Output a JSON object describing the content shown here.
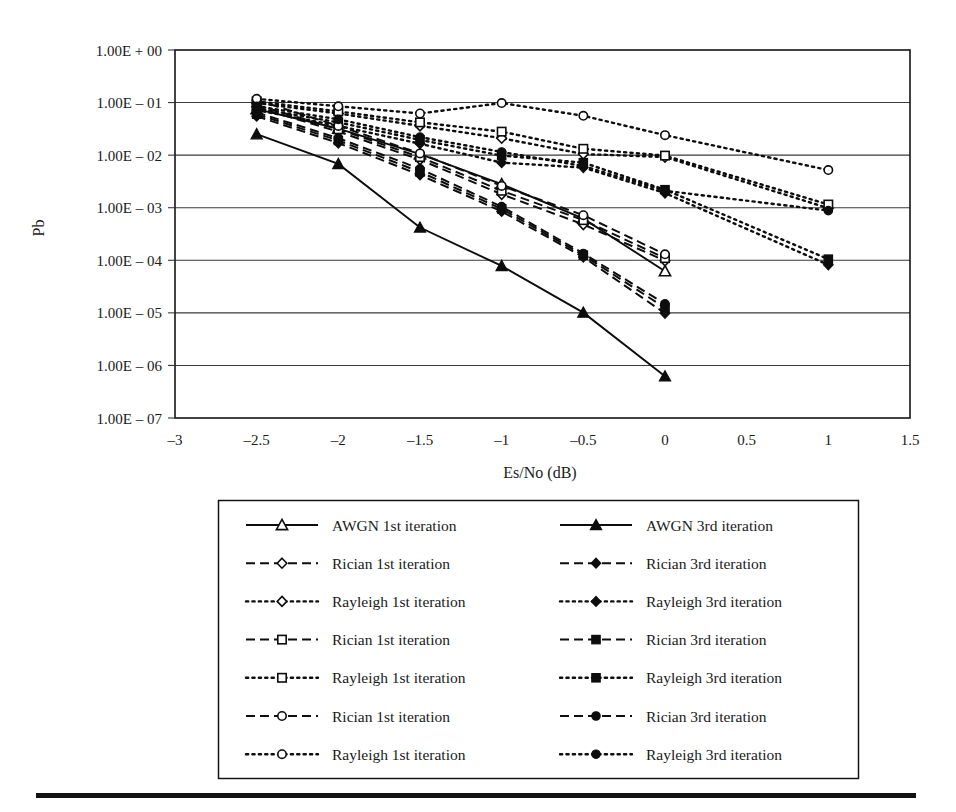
{
  "figure": {
    "background": "#ffffff",
    "ink_color": "#0d0d0d",
    "bottom_rule": true
  },
  "axes": {
    "ylabel": "Pb",
    "xlabel": "Es/No (dB)",
    "y_tick_labels": [
      "1.00E + 00",
      "1.00E – 01",
      "1.00E – 02",
      "1.00E – 03",
      "1.00E – 04",
      "1.00E – 05",
      "1.00E – 06",
      "1.00E – 07"
    ],
    "x_tick_labels": [
      "–3",
      "–2.5",
      "–2",
      "–1.5",
      "–1",
      "–0.5",
      "0",
      "0.5",
      "1",
      "1.5"
    ]
  },
  "chart_data": {
    "type": "line",
    "title": "",
    "xlabel": "Es/No (dB)",
    "ylabel": "Pb",
    "yscale": "log",
    "xlim": [
      -3,
      1.5
    ],
    "ylim": [
      1e-07,
      1
    ],
    "grid": true,
    "legend_position": "below",
    "x_ticks": [
      -3,
      -2.5,
      -2,
      -1.5,
      -1,
      -0.5,
      0,
      0.5,
      1,
      1.5
    ],
    "y_ticks": [
      1,
      0.1,
      0.01,
      0.001,
      0.0001,
      1e-05,
      1e-06,
      1e-07
    ],
    "series": [
      {
        "name": "AWGN 1st iteration",
        "label": "AWGN 1st iteration",
        "marker": "triangle",
        "fill": "open",
        "linestyle": "solid",
        "x": [
          -2.5,
          -2,
          -1.5,
          -1,
          -0.5,
          0
        ],
        "values": [
          0.075,
          0.032,
          0.0105,
          0.0028,
          0.00062,
          6.2e-05
        ]
      },
      {
        "name": "AWGN 3rd iteration",
        "label": "AWGN 3rd iteration",
        "marker": "triangle",
        "fill": "filled",
        "linestyle": "solid",
        "x": [
          -2.5,
          -2,
          -1.5,
          -1,
          -0.5,
          0
        ],
        "values": [
          0.025,
          0.0068,
          0.00042,
          7.8e-05,
          1.01e-05,
          6.2e-07
        ]
      },
      {
        "name": "Rician 1st iteration (diamond)",
        "label": "Rician 1st iteration",
        "marker": "diamond",
        "fill": "open",
        "linestyle": "dashed",
        "x": [
          -2.5,
          -2,
          -1.5,
          -1,
          -0.5,
          0
        ],
        "values": [
          0.082,
          0.028,
          0.0082,
          0.0018,
          0.00048,
          9.8e-05
        ]
      },
      {
        "name": "Rician 3rd iteration (diamond)",
        "label": "Rician 3rd iteration",
        "marker": "diamond",
        "fill": "filled",
        "linestyle": "dashed",
        "x": [
          -2.5,
          -2,
          -1.5,
          -1,
          -0.5,
          0
        ],
        "values": [
          0.055,
          0.017,
          0.0042,
          0.00085,
          0.000115,
          9.8e-06
        ]
      },
      {
        "name": "Rayleigh 1st iteration (diamond)",
        "label": "Rayleigh 1st iteration",
        "marker": "diamond",
        "fill": "open",
        "linestyle": "dotted",
        "x": [
          -2.5,
          -2,
          -1.5,
          -1,
          -0.5,
          0,
          1
        ],
        "values": [
          0.098,
          0.062,
          0.036,
          0.021,
          0.0105,
          0.0092,
          0.00098
        ]
      },
      {
        "name": "Rayleigh 3rd iteration (diamond)",
        "label": "Rayleigh 3rd iteration",
        "marker": "diamond",
        "fill": "filled",
        "linestyle": "dotted",
        "x": [
          -2.5,
          -2,
          -1.5,
          -1,
          -0.5,
          0,
          1
        ],
        "values": [
          0.072,
          0.036,
          0.0165,
          0.0072,
          0.0058,
          0.0019,
          8.2e-05
        ]
      },
      {
        "name": "Rician 1st iteration (square)",
        "label": "Rician 1st iteration",
        "marker": "square",
        "fill": "open",
        "linestyle": "dashed",
        "x": [
          -2.5,
          -2,
          -1.5,
          -1,
          -0.5,
          0
        ],
        "values": [
          0.09,
          0.031,
          0.0092,
          0.0021,
          0.00058,
          0.00011
        ]
      },
      {
        "name": "Rician 3rd iteration (square)",
        "label": "Rician 3rd iteration",
        "marker": "square",
        "fill": "filled",
        "linestyle": "dashed",
        "x": [
          -2.5,
          -2,
          -1.5,
          -1,
          -0.5,
          0
        ],
        "values": [
          0.06,
          0.019,
          0.0048,
          0.00095,
          0.000125,
          1.25e-05
        ]
      },
      {
        "name": "Rayleigh 1st iteration (square)",
        "label": "Rayleigh 1st iteration",
        "marker": "square",
        "fill": "open",
        "linestyle": "dotted",
        "x": [
          -2.5,
          -2,
          -1.5,
          -1,
          -0.5,
          0,
          1
        ],
        "values": [
          0.105,
          0.068,
          0.042,
          0.028,
          0.0132,
          0.0098,
          0.00115
        ]
      },
      {
        "name": "Rayleigh 3rd iteration (square)",
        "label": "Rayleigh 3rd iteration",
        "marker": "square",
        "fill": "filled",
        "linestyle": "dotted",
        "x": [
          -2.5,
          -2,
          -1.5,
          -1,
          -0.5,
          0,
          1
        ],
        "values": [
          0.078,
          0.042,
          0.0195,
          0.0098,
          0.0072,
          0.0022,
          0.000105
        ]
      },
      {
        "name": "Rician 1st iteration (circle)",
        "label": "Rician 1st iteration",
        "marker": "circle",
        "fill": "open",
        "linestyle": "dashed",
        "x": [
          -2.5,
          -2,
          -1.5,
          -1,
          -0.5,
          0
        ],
        "values": [
          0.112,
          0.036,
          0.0108,
          0.0026,
          0.00072,
          0.00013
        ]
      },
      {
        "name": "Rician 3rd iteration (circle)",
        "label": "Rician 3rd iteration",
        "marker": "circle",
        "fill": "filled",
        "linestyle": "dashed",
        "x": [
          -2.5,
          -2,
          -1.5,
          -1,
          -0.5,
          0
        ],
        "values": [
          0.065,
          0.021,
          0.0055,
          0.00105,
          0.000135,
          1.48e-05
        ]
      },
      {
        "name": "Rayleigh 1st iteration (circle)",
        "label": "Rayleigh 1st iteration",
        "marker": "circle",
        "fill": "open",
        "linestyle": "dotted",
        "x": [
          -2.5,
          -2,
          -1.5,
          -1,
          -0.5,
          0,
          1
        ],
        "values": [
          0.118,
          0.085,
          0.062,
          0.098,
          0.056,
          0.024,
          0.0052
        ]
      },
      {
        "name": "Rayleigh 3rd iteration (circle)",
        "label": "Rayleigh 3rd iteration",
        "marker": "circle",
        "fill": "filled",
        "linestyle": "dotted",
        "x": [
          -2.5,
          -2,
          -1.5,
          -1,
          -0.5,
          0,
          1
        ],
        "values": [
          0.085,
          0.048,
          0.022,
          0.0115,
          0.0062,
          0.0021,
          0.00088
        ]
      }
    ]
  },
  "legend": {
    "columns": 2,
    "entries_left": [
      {
        "label": "AWGN 1st iteration",
        "marker": "triangle",
        "fill": "open",
        "linestyle": "solid"
      },
      {
        "label": "Rician 1st iteration",
        "marker": "diamond",
        "fill": "open",
        "linestyle": "dashed"
      },
      {
        "label": "Rayleigh 1st iteration",
        "marker": "diamond",
        "fill": "open",
        "linestyle": "dotted"
      },
      {
        "label": "Rician 1st iteration",
        "marker": "square",
        "fill": "open",
        "linestyle": "dashed"
      },
      {
        "label": "Rayleigh 1st iteration",
        "marker": "square",
        "fill": "open",
        "linestyle": "dotted"
      },
      {
        "label": "Rician 1st iteration",
        "marker": "circle",
        "fill": "open",
        "linestyle": "dashed"
      },
      {
        "label": "Rayleigh 1st iteration",
        "marker": "circle",
        "fill": "open",
        "linestyle": "dotted"
      }
    ],
    "entries_right": [
      {
        "label": "AWGN 3rd iteration",
        "marker": "triangle",
        "fill": "filled",
        "linestyle": "solid"
      },
      {
        "label": "Rician 3rd iteration",
        "marker": "diamond",
        "fill": "filled",
        "linestyle": "dashed"
      },
      {
        "label": "Rayleigh 3rd iteration",
        "marker": "diamond",
        "fill": "filled",
        "linestyle": "dotted"
      },
      {
        "label": "Rician 3rd iteration",
        "marker": "square",
        "fill": "filled",
        "linestyle": "dashed"
      },
      {
        "label": "Rayleigh 3rd iteration",
        "marker": "square",
        "fill": "filled",
        "linestyle": "dotted"
      },
      {
        "label": "Rician 3rd iteration",
        "marker": "circle",
        "fill": "filled",
        "linestyle": "dashed"
      },
      {
        "label": "Rayleigh 3rd iteration",
        "marker": "circle",
        "fill": "filled",
        "linestyle": "dotted"
      }
    ]
  }
}
